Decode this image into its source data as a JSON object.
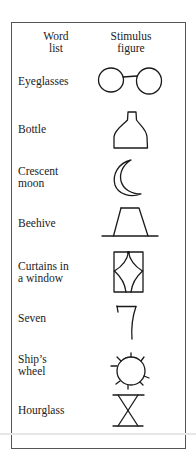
{
  "table": {
    "headers": {
      "word_list": [
        "Word",
        "list"
      ],
      "stimulus_figure": [
        "Stimulus",
        "figure"
      ]
    },
    "rows": [
      {
        "word": [
          "Eyeglasses"
        ],
        "figure_icon": "eyeglasses-drawing"
      },
      {
        "word": [
          "Bottle"
        ],
        "figure_icon": "bottle-drawing"
      },
      {
        "word": [
          "Crescent",
          "moon"
        ],
        "figure_icon": "crescent-moon-drawing"
      },
      {
        "word": [
          "Beehive"
        ],
        "figure_icon": "beehive-drawing"
      },
      {
        "word": [
          "Curtains in",
          "a window"
        ],
        "figure_icon": "curtains-in-window-drawing"
      },
      {
        "word": [
          "Seven"
        ],
        "figure_icon": "seven-drawing"
      },
      {
        "word": [
          "Ship’s",
          "wheel"
        ],
        "figure_icon": "ships-wheel-drawing"
      },
      {
        "word": [
          "Hourglass"
        ],
        "figure_icon": "hourglass-drawing"
      }
    ]
  }
}
